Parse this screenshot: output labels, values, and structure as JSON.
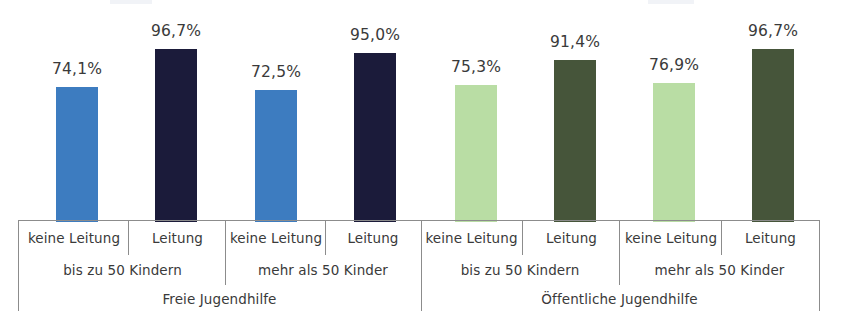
{
  "chart_data": {
    "type": "bar",
    "title": "",
    "subtitle": "",
    "xlabel": "",
    "ylabel": "",
    "ylim": [
      0,
      100
    ],
    "grid": false,
    "legend_position": "none",
    "value_label_suffix": "%",
    "decimal_separator": ",",
    "categories": [
      "keine Leitung",
      "Leitung",
      "keine Leitung",
      "Leitung",
      "keine Leitung",
      "Leitung",
      "keine Leitung",
      "Leitung"
    ],
    "values": [
      74.1,
      96.7,
      72.5,
      95.0,
      75.3,
      91.4,
      76.9,
      96.7
    ],
    "value_labels": [
      "74,1%",
      "96,7%",
      "72,5%",
      "95,0%",
      "75,3%",
      "91,4%",
      "76,9%",
      "96,7%"
    ],
    "bar_colors": [
      "#3D7CC0",
      "#1B1B3A",
      "#3D7CC0",
      "#1B1B3A",
      "#B9DDA4",
      "#46553A",
      "#B9DDA4",
      "#46553A"
    ],
    "group_level_1": [
      {
        "label": "bis zu 50 Kindern",
        "span": 2
      },
      {
        "label": "mehr als 50 Kinder",
        "span": 2
      },
      {
        "label": "bis zu 50 Kindern",
        "span": 2
      },
      {
        "label": "mehr als 50 Kinder",
        "span": 2
      }
    ],
    "group_level_2": [
      {
        "label": "Freie Jugendhilfe",
        "span": 4
      },
      {
        "label": "Öffentliche Jugendhilfe",
        "span": 4
      }
    ]
  },
  "bars": [
    {
      "value_label": "74,1%",
      "color": "#3D7CC0",
      "left": 56,
      "width": 42,
      "height": 135
    },
    {
      "value_label": "96,7%",
      "color": "#1B1B3A",
      "left": 155,
      "width": 42,
      "height": 173
    },
    {
      "value_label": "72,5%",
      "color": "#3D7CC0",
      "left": 255,
      "width": 42,
      "height": 132
    },
    {
      "value_label": "95,0%",
      "color": "#1B1B3A",
      "left": 354,
      "width": 42,
      "height": 169
    },
    {
      "value_label": "75,3%",
      "color": "#B9DDA4",
      "left": 455,
      "width": 42,
      "height": 137
    },
    {
      "value_label": "91,4%",
      "color": "#46553A",
      "left": 554,
      "width": 42,
      "height": 162
    },
    {
      "value_label": "76,9%",
      "color": "#B9DDA4",
      "left": 653,
      "width": 42,
      "height": 139
    },
    {
      "value_label": "96,7%",
      "color": "#46553A",
      "left": 752,
      "width": 42,
      "height": 173
    }
  ],
  "axis_table": {
    "leitung_row": [
      "keine Leitung",
      "Leitung",
      "keine Leitung",
      "Leitung",
      "keine Leitung",
      "Leitung",
      "keine Leitung",
      "Leitung"
    ],
    "size_row": [
      "bis zu 50 Kindern",
      "mehr als 50 Kinder",
      "bis zu 50 Kindern",
      "mehr als 50 Kinder"
    ],
    "provider_row": [
      "Freie Jugendhilfe",
      "Öffentliche Jugendhilfe"
    ]
  },
  "colors": {
    "blue_light": "#3D7CC0",
    "blue_dark": "#1B1B3A",
    "green_light": "#B9DDA4",
    "green_dark": "#46553A",
    "rule": "#8C8C8C",
    "text": "#3A3A3A"
  }
}
